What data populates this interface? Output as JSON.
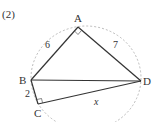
{
  "problem_number": "(2)",
  "vertices": {
    "A": {
      "label": "A",
      "x": 78,
      "y": 27
    },
    "B": {
      "label": "B",
      "x": 31,
      "y": 80
    },
    "C": {
      "label": "C",
      "x": 38,
      "y": 104
    },
    "D": {
      "label": "D",
      "x": 141,
      "y": 81
    }
  },
  "edge_labels": {
    "AB": "6",
    "AD": "7",
    "BC": "2",
    "CD": "x"
  },
  "right_angles": [
    "A",
    "C"
  ],
  "colors": {
    "line": "#333333",
    "circle": "#aaaaaa"
  }
}
